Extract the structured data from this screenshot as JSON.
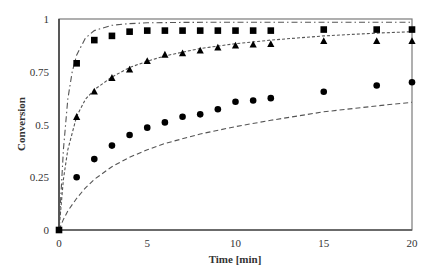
{
  "chart_data": {
    "type": "scatter",
    "title": "",
    "xlabel": "Time [min]",
    "ylabel": "Conversion",
    "xlim": [
      0,
      20
    ],
    "ylim": [
      0,
      1
    ],
    "x_ticks": [
      0,
      5,
      10,
      15,
      20
    ],
    "x_tick_labels": [
      "0",
      "5",
      "10",
      "15",
      "20"
    ],
    "y_ticks": [
      0,
      0.25,
      0.5,
      0.75,
      1
    ],
    "y_tick_labels": [
      "0",
      "0.25",
      "0.5",
      "0.75",
      "1"
    ],
    "grid": false,
    "legend": null,
    "series": [
      {
        "name": "squares",
        "marker": "square",
        "color": "#000000",
        "x": [
          0,
          1,
          2,
          3,
          4,
          5,
          6,
          7,
          8,
          9,
          10,
          11,
          12,
          15,
          18,
          20
        ],
        "y": [
          0,
          0.79,
          0.9,
          0.92,
          0.94,
          0.945,
          0.945,
          0.945,
          0.945,
          0.945,
          0.945,
          0.945,
          0.945,
          0.95,
          0.95,
          0.95
        ]
      },
      {
        "name": "triangles",
        "marker": "triangle",
        "color": "#000000",
        "x": [
          0,
          1,
          2,
          3,
          4,
          5,
          6,
          7,
          8,
          9,
          10,
          11,
          12,
          15,
          18,
          20
        ],
        "y": [
          0,
          0.535,
          0.655,
          0.72,
          0.76,
          0.8,
          0.83,
          0.837,
          0.85,
          0.864,
          0.873,
          0.878,
          0.88,
          0.895,
          0.895,
          0.895
        ]
      },
      {
        "name": "circles",
        "marker": "circle",
        "color": "#000000",
        "x": [
          0,
          1,
          2,
          3,
          4,
          5,
          6,
          7,
          8,
          9,
          10,
          11,
          12,
          15,
          18,
          20
        ],
        "y": [
          0,
          0.25,
          0.336,
          0.4,
          0.45,
          0.485,
          0.51,
          0.537,
          0.548,
          0.572,
          0.608,
          0.614,
          0.625,
          0.655,
          0.685,
          0.7
        ]
      }
    ],
    "model_curves": [
      {
        "name": "dash-dot model (squares)",
        "style": "dash-dot",
        "color": "#555555",
        "x": [
          0,
          0.25,
          0.5,
          0.75,
          1,
          1.5,
          2,
          3,
          4,
          5,
          7,
          10,
          15,
          20
        ],
        "y": [
          0,
          0.38,
          0.62,
          0.75,
          0.83,
          0.91,
          0.945,
          0.97,
          0.978,
          0.982,
          0.984,
          0.985,
          0.985,
          0.985
        ]
      },
      {
        "name": "short-dash model (triangles)",
        "style": "short-dash",
        "color": "#555555",
        "x": [
          0,
          0.25,
          0.5,
          1,
          1.5,
          2,
          3,
          4,
          5,
          6,
          8,
          10,
          12,
          15,
          18,
          20
        ],
        "y": [
          0,
          0.24,
          0.38,
          0.54,
          0.62,
          0.665,
          0.725,
          0.77,
          0.8,
          0.825,
          0.86,
          0.883,
          0.9,
          0.92,
          0.933,
          0.94
        ]
      },
      {
        "name": "long-dash model (circles)",
        "style": "long-dash",
        "color": "#555555",
        "x": [
          0,
          0.25,
          0.5,
          1,
          1.5,
          2,
          3,
          4,
          5,
          6,
          8,
          10,
          12,
          15,
          18,
          20
        ],
        "y": [
          0,
          0.05,
          0.09,
          0.15,
          0.2,
          0.24,
          0.3,
          0.345,
          0.38,
          0.41,
          0.455,
          0.49,
          0.52,
          0.56,
          0.588,
          0.605
        ]
      }
    ]
  },
  "plot_area": {
    "left": 59,
    "right": 412,
    "top": 19,
    "bottom": 230
  }
}
